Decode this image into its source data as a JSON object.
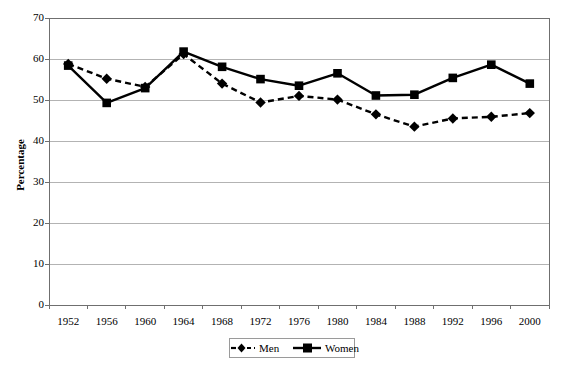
{
  "chart_data": {
    "type": "line",
    "title": "",
    "subtitle": "",
    "xlabel": "",
    "ylabel": "Percentage",
    "categories": [
      "1952",
      "1956",
      "1960",
      "1964",
      "1968",
      "1972",
      "1976",
      "1980",
      "1984",
      "1988",
      "1992",
      "1996",
      "2000"
    ],
    "x": [
      1952,
      1956,
      1960,
      1964,
      1968,
      1972,
      1976,
      1980,
      1984,
      1988,
      1992,
      1996,
      2000
    ],
    "xlim": [
      1950,
      2002
    ],
    "ylim": [
      0,
      70
    ],
    "yticks": [
      0,
      10,
      20,
      30,
      40,
      50,
      60,
      70
    ],
    "ytick_labels": [
      "0",
      "10",
      "20",
      "30",
      "40",
      "50",
      "60",
      "70"
    ],
    "grid": true,
    "grid_axis": "y",
    "legend_position": "bottom",
    "series": [
      {
        "name": "Men",
        "style": "dashed",
        "marker": "diamond",
        "color": "#000000",
        "values": [
          58.8,
          55.2,
          53.2,
          61.2,
          54.0,
          49.4,
          51.0,
          50.1,
          46.5,
          43.5,
          45.5,
          45.9,
          46.8
        ]
      },
      {
        "name": "Women",
        "style": "solid",
        "marker": "square",
        "color": "#000000",
        "values": [
          58.4,
          49.3,
          52.9,
          61.8,
          58.1,
          55.1,
          53.5,
          56.5,
          51.1,
          51.3,
          55.4,
          58.6,
          54.0
        ]
      }
    ]
  },
  "axis": {
    "y_title": "Percentage"
  },
  "legend": {
    "entries": [
      {
        "label": "Men"
      },
      {
        "label": "Women"
      }
    ]
  },
  "colors": {
    "plot_line": "#000000",
    "grid": "#b3b3b3",
    "axis": "#6f6f6f",
    "background": "#ffffff"
  }
}
